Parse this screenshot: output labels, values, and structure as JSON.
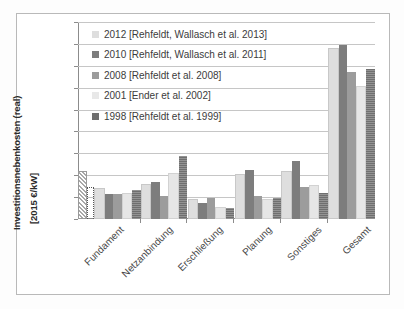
{
  "chart_data": {
    "type": "bar",
    "title": "",
    "subtitle": "",
    "xlabel": "",
    "ylabel_line1": "Investitionsnebenkosten (real)",
    "ylabel_line2": "[2015 €/kW]",
    "ylim": [
      0,
      450
    ],
    "ytick_step": 50,
    "yticks": [
      450,
      400,
      350,
      300,
      250,
      200,
      150,
      100,
      50,
      0
    ],
    "grid": true,
    "legend_position": "top-left-inside",
    "categories": [
      "Fundament",
      "Netzanbindung",
      "Erschließung",
      "Planung",
      "Sonstiges",
      "Gesamt"
    ],
    "series": [
      {
        "name": "2012 [Rehfeldt, Wallasch et al. 2013]",
        "color": "#dedede",
        "values": [
          67,
          75,
          42,
          99,
          106,
          385
        ]
      },
      {
        "name": "2010 [Rehfeldt, Wallasch et al. 2011]",
        "color": "#7d7d7d",
        "values": [
          58,
          85,
          36,
          111,
          132,
          397
        ]
      },
      {
        "name": "2008 [Rehfeldt et al. 2008]",
        "color": "#9c9c9c",
        "values": [
          58,
          52,
          49,
          52,
          72,
          335
        ]
      },
      {
        "name": "2001 [Ender et al. 2002]",
        "color": "#e8e8e8",
        "values": [
          55,
          100,
          24,
          41,
          72,
          300
        ]
      },
      {
        "name": "1998 [Rehfeldt et al. 1999]",
        "color": "#6f6f6f",
        "values": [
          67,
          145,
          26,
          47,
          60,
          343
        ]
      }
    ],
    "annotations": [
      {
        "category": "Fundament",
        "note": "hatched overlay bar reaching about 105",
        "value": 105,
        "style": "diagonal-hatch"
      },
      {
        "category": "Fundament",
        "note": "dotted outline bar at about 70",
        "value": 70,
        "style": "dotted-outline"
      }
    ]
  },
  "legend": {
    "items": [
      {
        "label": "2012 [Rehfeldt, Wallasch et al. 2013]",
        "swatch": "s2012"
      },
      {
        "label": "2010 [Rehfeldt, Wallasch et al. 2011]",
        "swatch": "s2010"
      },
      {
        "label": "2008 [Rehfeldt et al. 2008]",
        "swatch": "s2008"
      },
      {
        "label": "2001 [Ender et al. 2002]",
        "swatch": "s2001"
      },
      {
        "label": "1998 [Rehfeldt et al. 1999]",
        "swatch": "s1998"
      }
    ]
  },
  "axis": {
    "y_title_line1": "Investitionsnebenkosten (real)",
    "y_title_line2": "[2015 €/kW]",
    "y_ticks": [
      "450",
      "400",
      "350",
      "300",
      "250",
      "200",
      "150",
      "100",
      "50",
      "0"
    ]
  },
  "colors": {
    "grid": "#c6c6c6",
    "axis": "#8c8c8c",
    "text": "#3c3c3c",
    "frame": "#b9b9b9",
    "background": "#ffffff"
  }
}
